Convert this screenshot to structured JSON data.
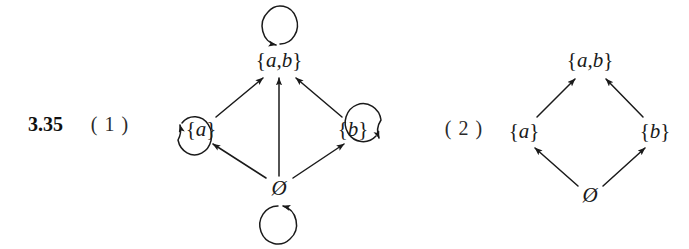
{
  "figure": {
    "exercise_number": "3.35",
    "background_color": "#ffffff",
    "ink_color": "#1a1a1a",
    "width": 689,
    "height": 249
  },
  "diagrams": [
    {
      "part_label": "( 1 )",
      "caption": "reflexive subset relation digraph on the power set of {a,b}",
      "nodes": [
        {
          "id": "ab",
          "label_braces_open": "{",
          "label_text": "a,b",
          "label_braces_close": "}",
          "display": "{a,b}",
          "x": 279,
          "y": 60
        },
        {
          "id": "a",
          "label_braces_open": "{",
          "label_text": "a",
          "label_braces_close": "}",
          "display": "{a}",
          "x": 201,
          "y": 129
        },
        {
          "id": "b",
          "label_braces_open": "{",
          "label_text": "b",
          "label_braces_close": "}",
          "display": "{b}",
          "x": 353,
          "y": 129
        },
        {
          "id": "empty",
          "display": "Ø",
          "x": 279,
          "y": 188
        }
      ],
      "edges": [
        {
          "from": "empty",
          "to": "a"
        },
        {
          "from": "empty",
          "to": "b"
        },
        {
          "from": "empty",
          "to": "ab"
        },
        {
          "from": "a",
          "to": "ab"
        },
        {
          "from": "b",
          "to": "ab"
        }
      ],
      "self_loops": [
        {
          "node": "ab",
          "position": "above"
        },
        {
          "node": "a",
          "position": "left"
        },
        {
          "node": "b",
          "position": "right"
        },
        {
          "node": "empty",
          "position": "below"
        }
      ]
    },
    {
      "part_label": "( 2 )",
      "caption": "Hasse diagram of the subset relation on the power set of {a,b}",
      "nodes": [
        {
          "id": "ab",
          "label_braces_open": "{",
          "label_text": "a,b",
          "label_braces_close": "}",
          "display": "{a,b}",
          "x": 590,
          "y": 60
        },
        {
          "id": "a",
          "label_braces_open": "{",
          "label_text": "a",
          "label_braces_close": "}",
          "display": "{a}",
          "x": 524,
          "y": 131
        },
        {
          "id": "b",
          "label_braces_open": "{",
          "label_text": "b",
          "label_braces_close": "}",
          "display": "{b}",
          "x": 655,
          "y": 131
        },
        {
          "id": "empty",
          "display": "Ø",
          "x": 590,
          "y": 195
        }
      ],
      "edges": [
        {
          "from": "empty",
          "to": "a"
        },
        {
          "from": "empty",
          "to": "b"
        },
        {
          "from": "a",
          "to": "ab"
        },
        {
          "from": "b",
          "to": "ab"
        }
      ],
      "self_loops": []
    }
  ],
  "labels": {
    "exercise": "3.35",
    "part_one": "( 1 )",
    "part_two": "( 2 )",
    "set_ab": "{a,b}",
    "set_a": "{a}",
    "set_b": "{b}",
    "empty_set": "Ø"
  }
}
